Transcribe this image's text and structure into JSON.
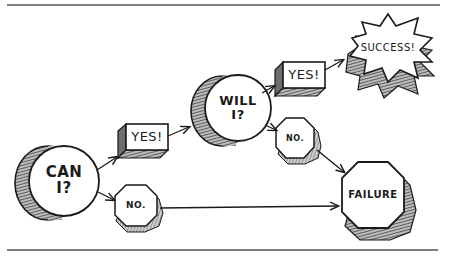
{
  "diagram": {
    "type": "flowchart",
    "style": "hand-drawn comic",
    "colors": {
      "ink": "#1a1a1a",
      "rule": "#555555",
      "shade": "#777777",
      "face": "#ffffff"
    },
    "nodes": [
      {
        "id": "can",
        "shape": "cylinder",
        "label": "CAN\nI?"
      },
      {
        "id": "yes1",
        "shape": "box-3d",
        "label": "YES!"
      },
      {
        "id": "no1",
        "shape": "octagon",
        "label": "NO."
      },
      {
        "id": "will",
        "shape": "cylinder",
        "label": "WILL\nI?"
      },
      {
        "id": "yes2",
        "shape": "box-3d",
        "label": "YES!"
      },
      {
        "id": "no2",
        "shape": "octagon",
        "label": "NO."
      },
      {
        "id": "success",
        "shape": "starburst",
        "label": "SUCCESS!"
      },
      {
        "id": "failure",
        "shape": "octagon",
        "label": "FAILURE"
      }
    ],
    "edges": [
      {
        "from": "can",
        "to": "yes1"
      },
      {
        "from": "can",
        "to": "no1"
      },
      {
        "from": "yes1",
        "to": "will"
      },
      {
        "from": "no1",
        "to": "failure"
      },
      {
        "from": "will",
        "to": "yes2"
      },
      {
        "from": "will",
        "to": "no2"
      },
      {
        "from": "yes2",
        "to": "success"
      },
      {
        "from": "no2",
        "to": "failure"
      }
    ]
  }
}
